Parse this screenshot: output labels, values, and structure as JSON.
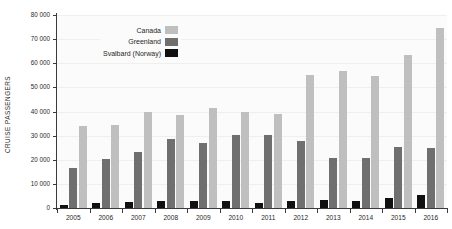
{
  "chart_data": {
    "type": "bar",
    "title": "",
    "xlabel": "",
    "ylabel": "CRUISE PASSENGERS",
    "ylim": [
      0,
      80000
    ],
    "ytick_labels": [
      "0",
      "10 000",
      "20 000",
      "30 000",
      "40 000",
      "50 000",
      "60 000",
      "70 000",
      "80 000"
    ],
    "ytick_values": [
      0,
      10000,
      20000,
      30000,
      40000,
      50000,
      60000,
      70000,
      80000
    ],
    "grid": true,
    "legend_position": "top-left-inside",
    "categories": [
      "2005",
      "2006",
      "2007",
      "2008",
      "2009",
      "2010",
      "2011",
      "2012",
      "2013",
      "2014",
      "2015",
      "2016"
    ],
    "series": [
      {
        "name": "Svalbard (Norway)",
        "color": "#101010",
        "values": [
          1300,
          2200,
          2600,
          3100,
          2900,
          3000,
          2100,
          3000,
          3400,
          3000,
          4100,
          5300
        ]
      },
      {
        "name": "Greenland",
        "color": "#6f6f6f",
        "values": [
          16400,
          20300,
          23400,
          28800,
          26800,
          30300,
          30100,
          27600,
          20900,
          20600,
          25400,
          24900
        ]
      },
      {
        "name": "Canada",
        "color": "#bfbfbf",
        "values": [
          33900,
          34600,
          39700,
          38500,
          41500,
          40000,
          38900,
          55000,
          56700,
          54700,
          63500,
          74800
        ]
      }
    ],
    "legend_entries": [
      {
        "label": "Canada",
        "color": "#bfbfbf"
      },
      {
        "label": "Greenland",
        "color": "#6f6f6f"
      },
      {
        "label": "Svalbard (Norway)",
        "color": "#101010"
      }
    ]
  }
}
